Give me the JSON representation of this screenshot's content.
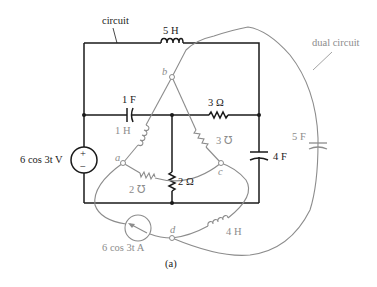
{
  "diagram": {
    "caption": "(a)",
    "colors": {
      "circuit": "#1a1a1a",
      "dual": "#8c8c8c"
    },
    "callouts": {
      "circuit": "circuit",
      "dual": "dual circuit"
    },
    "circuit": {
      "inductor_top": "5 H",
      "capacitor_mid": "1 F",
      "resistor_mid": "3 Ω",
      "resistor_center": "2 Ω",
      "capacitor_right": "4 F",
      "voltage_source": "6 cos 3t V",
      "voltage_source_plus": "+",
      "voltage_source_minus": "−"
    },
    "dual": {
      "nodes": {
        "a": "a",
        "b": "b",
        "c": "c",
        "d": "d"
      },
      "inductor_ba": "1 H",
      "conductance_bc": "3 ℧",
      "conductance_ac": "2 ℧",
      "inductor_dc": "4 H",
      "capacitor_bd": "5 F",
      "current_source": "6 cos 3t A"
    }
  }
}
